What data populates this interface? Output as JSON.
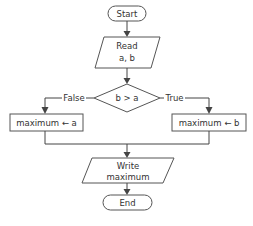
{
  "flowchart": {
    "start": {
      "label": "Start"
    },
    "read": {
      "line1": "Read",
      "line2": "a, b"
    },
    "decision": {
      "label": "b > a",
      "false_label": "False",
      "true_label": "True"
    },
    "assign_false": {
      "label": "maximum ← a"
    },
    "assign_true": {
      "label": "maximum ← b"
    },
    "write": {
      "line1": "Write",
      "line2": "maximum"
    },
    "end": {
      "label": "End"
    }
  },
  "colors": {
    "stroke": "#555555",
    "text": "#333333",
    "background": "#ffffff"
  }
}
